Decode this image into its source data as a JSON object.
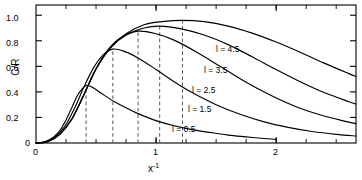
{
  "chart_data": {
    "type": "line",
    "title": "",
    "xlabel": "x⁻¹",
    "ylabel": "C/R",
    "xlim": [
      0,
      2.665
    ],
    "ylim": [
      0,
      1.08
    ],
    "grid": false,
    "legend_position": "inline-right-of-curves",
    "x_ticks": [
      0,
      1,
      2
    ],
    "x_tick_labels": [
      "0",
      "1",
      "2"
    ],
    "x_minor_tick_step": 0.25,
    "y_ticks": [
      0,
      0.2,
      0.4,
      0.6,
      0.8,
      1.0
    ],
    "y_tick_labels": [
      "0",
      "0.2",
      "0.4",
      "0.6",
      "0.8",
      "1.0"
    ],
    "frame": "box",
    "annotations": [
      {
        "text": "dashed vertical lines mark each curve peak"
      }
    ],
    "series": [
      {
        "name": "l = 0.5",
        "label": "l = 0.5",
        "peak_x": 0.417,
        "peak_y": 0.45,
        "x": [
          0.0,
          0.05,
          0.1,
          0.15,
          0.2,
          0.25,
          0.3,
          0.35,
          0.417,
          0.48,
          0.55,
          0.65,
          0.75,
          0.85,
          1.0,
          1.15,
          1.3,
          1.45,
          1.6,
          1.75,
          1.9,
          2.0
        ],
        "y": [
          0.0,
          0.005,
          0.02,
          0.05,
          0.1,
          0.18,
          0.28,
          0.38,
          0.45,
          0.43,
          0.385,
          0.325,
          0.275,
          0.23,
          0.175,
          0.135,
          0.105,
          0.082,
          0.062,
          0.048,
          0.035,
          0.028
        ]
      },
      {
        "name": "l = 1.5",
        "label": "l = 1.5",
        "peak_x": 0.64,
        "peak_y": 0.735,
        "x": [
          0.0,
          0.08,
          0.16,
          0.24,
          0.32,
          0.4,
          0.48,
          0.56,
          0.64,
          0.74,
          0.85,
          1.0,
          1.15,
          1.3,
          1.5,
          1.7,
          1.9,
          2.1,
          2.3,
          2.5,
          2.665
        ],
        "y": [
          0.0,
          0.01,
          0.05,
          0.13,
          0.27,
          0.44,
          0.59,
          0.69,
          0.735,
          0.715,
          0.665,
          0.575,
          0.48,
          0.395,
          0.3,
          0.225,
          0.165,
          0.122,
          0.09,
          0.068,
          0.055
        ]
      },
      {
        "name": "l = 2.5",
        "label": "l = 2.5",
        "peak_x": 0.85,
        "peak_y": 0.875,
        "x": [
          0.0,
          0.1,
          0.2,
          0.3,
          0.4,
          0.5,
          0.6,
          0.7,
          0.85,
          1.0,
          1.15,
          1.35,
          1.55,
          1.75,
          1.95,
          2.15,
          2.35,
          2.55,
          2.665
        ],
        "y": [
          0.0,
          0.012,
          0.07,
          0.19,
          0.38,
          0.58,
          0.73,
          0.82,
          0.875,
          0.855,
          0.805,
          0.705,
          0.59,
          0.475,
          0.375,
          0.29,
          0.225,
          0.175,
          0.152
        ]
      },
      {
        "name": "l = 3.5",
        "label": "l = 3.5",
        "peak_x": 1.03,
        "peak_y": 0.915,
        "x": [
          0.0,
          0.1,
          0.2,
          0.3,
          0.4,
          0.5,
          0.62,
          0.75,
          0.9,
          1.03,
          1.2,
          1.4,
          1.6,
          1.8,
          2.0,
          2.2,
          2.4,
          2.6,
          2.665
        ],
        "y": [
          0.0,
          0.012,
          0.07,
          0.19,
          0.38,
          0.58,
          0.745,
          0.845,
          0.9,
          0.915,
          0.895,
          0.845,
          0.77,
          0.675,
          0.575,
          0.48,
          0.395,
          0.325,
          0.305
        ]
      },
      {
        "name": "l = 4.5",
        "label": "l = 4.5",
        "peak_x": 1.22,
        "peak_y": 0.96,
        "x": [
          0.0,
          0.1,
          0.2,
          0.3,
          0.4,
          0.5,
          0.62,
          0.75,
          0.9,
          1.05,
          1.22,
          1.4,
          1.6,
          1.8,
          2.0,
          2.2,
          2.4,
          2.6,
          2.665
        ],
        "y": [
          0.0,
          0.012,
          0.07,
          0.19,
          0.38,
          0.58,
          0.745,
          0.855,
          0.925,
          0.95,
          0.96,
          0.95,
          0.915,
          0.86,
          0.79,
          0.71,
          0.625,
          0.545,
          0.52
        ]
      }
    ],
    "peak_markers": [
      {
        "series": "l = 0.5",
        "x": 0.417,
        "y": 0.45
      },
      {
        "series": "l = 1.5",
        "x": 0.64,
        "y": 0.735
      },
      {
        "series": "l = 2.5",
        "x": 0.85,
        "y": 0.875
      },
      {
        "series": "l = 3.5",
        "x": 1.03,
        "y": 0.915
      },
      {
        "series": "l = 4.5",
        "x": 1.22,
        "y": 0.96
      }
    ],
    "curve_label_positions": [
      {
        "text": "l = 4.5",
        "x": 1.53,
        "y": 0.8
      },
      {
        "text": "l = 3.5",
        "x": 1.43,
        "y": 0.64
      },
      {
        "text": "l = 2.5",
        "x": 1.33,
        "y": 0.48
      },
      {
        "text": "l = 1.5",
        "x": 1.3,
        "y": 0.325
      },
      {
        "text": "l = 0.5",
        "x": 1.17,
        "y": 0.165
      }
    ],
    "colors": {
      "axis": "#000000",
      "curve": "#000000",
      "dashed_marker": "#555555",
      "background": "#ffffff"
    }
  },
  "axes": {
    "y_title": "C/R",
    "x_title": "x⁻¹",
    "y_labels": [
      "1.0",
      "0.8",
      "0.6",
      "0.4",
      "0.2",
      "0"
    ],
    "x_labels": [
      "0",
      "1",
      "2"
    ]
  },
  "curve_labels": {
    "l45": "l = 4.5",
    "l35": "l = 3.5",
    "l25": "l = 2.5",
    "l15": "l = 1.5",
    "l05": "l = 0.5"
  }
}
